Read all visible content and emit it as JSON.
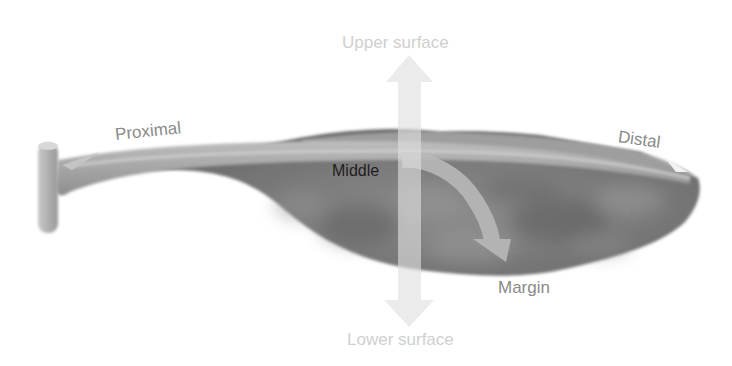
{
  "diagram": {
    "labels": {
      "upper": "Upper surface",
      "lower": "Lower surface",
      "proximal": "Proximal",
      "distal": "Distal",
      "middle": "Middle",
      "margin": "Margin"
    },
    "arrows": [
      {
        "name": "upper-surface-arrow",
        "direction": "up",
        "color": "#e6e6e6"
      },
      {
        "name": "lower-surface-arrow",
        "direction": "down",
        "color": "#e6e6e6"
      },
      {
        "name": "proximal-arrow",
        "direction": "left-along-midrib",
        "color": "#c8c8c8"
      },
      {
        "name": "distal-arrow",
        "direction": "right-along-midrib",
        "color": "#c8c8c8"
      },
      {
        "name": "middle-to-margin-arrow",
        "direction": "curved-down-right",
        "color": "#b4b4b4"
      }
    ],
    "colors": {
      "leaf_body": "#7a7a7a",
      "leaf_highlight": "#a8a8a8",
      "stem": "#b5b5b5",
      "label_light": "#cfcfcf",
      "label_mid": "#8a8a8a",
      "label_dark": "#1e1e1e",
      "background": "#ffffff"
    }
  }
}
